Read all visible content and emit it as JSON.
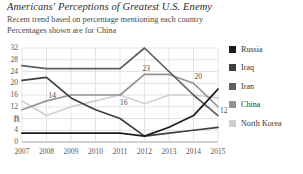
{
  "header": {
    "title": "Americans' Perceptions of Greatest U.S. Enemy",
    "subtitle1": "Recent trend based on percentage mentioning each country",
    "subtitle2": "Percentages shown are for China"
  },
  "legend": {
    "position": "right",
    "items": [
      {
        "label": "Russia",
        "color": "#1c1c1c"
      },
      {
        "label": "Iraq",
        "color": "#3f3f3f"
      },
      {
        "label": "Iran",
        "color": "#5e5e5e"
      },
      {
        "label": "China",
        "color": "#949494"
      },
      {
        "label": "North Korea",
        "color": "#cfcfcf"
      }
    ]
  },
  "chart_data": {
    "type": "line",
    "title": "Americans' Perceptions of Greatest U.S. Enemy",
    "subtitle": "Recent trend based on percentage mentioning each country",
    "note": "Percentages shown are for China",
    "xlabel": "",
    "ylabel": "",
    "x": [
      "2007",
      "2008",
      "2009",
      "2010",
      "2011",
      "2012",
      "2013",
      "2014",
      "2015"
    ],
    "categories": [
      "2007",
      "2008",
      "2009",
      "2010",
      "2011",
      "2012",
      "2013",
      "2014",
      "2015"
    ],
    "ylim": [
      0,
      32
    ],
    "yticks": [
      0,
      4,
      8,
      12,
      16,
      20,
      24,
      28,
      32
    ],
    "xticks": [
      "2007",
      "2008",
      "2009",
      "2010",
      "2011",
      "2012",
      "2013",
      "2014",
      "2015"
    ],
    "grid": true,
    "legend_position": "right",
    "series": [
      {
        "name": "Russia",
        "color": "#1c1c1c",
        "values": [
          3,
          3,
          3,
          3,
          3,
          2,
          5,
          9,
          18
        ]
      },
      {
        "name": "Iraq",
        "color": "#3f3f3f",
        "values": [
          21,
          22,
          15,
          11,
          8,
          2,
          3,
          4,
          5
        ]
      },
      {
        "name": "Iran",
        "color": "#5e5e5e",
        "values": [
          26,
          25,
          25,
          25,
          25,
          32,
          24,
          16,
          9
        ]
      },
      {
        "name": "China",
        "color": "#949494",
        "values": [
          11,
          14,
          16,
          16,
          16,
          23,
          23,
          20,
          12
        ]
      },
      {
        "name": "North Korea",
        "color": "#cfcfcf",
        "values": [
          14,
          9,
          12,
          14,
          16,
          13,
          16,
          16,
          15
        ]
      }
    ],
    "data_labels": {
      "series": "China",
      "points": [
        {
          "x": "2007",
          "value": "11"
        },
        {
          "x": "2008",
          "value": "14"
        },
        {
          "x": "2011",
          "value": "16"
        },
        {
          "x": "2012",
          "value": "23"
        },
        {
          "x": "2014",
          "value": "20"
        },
        {
          "x": "2015",
          "value": "12"
        }
      ]
    }
  }
}
